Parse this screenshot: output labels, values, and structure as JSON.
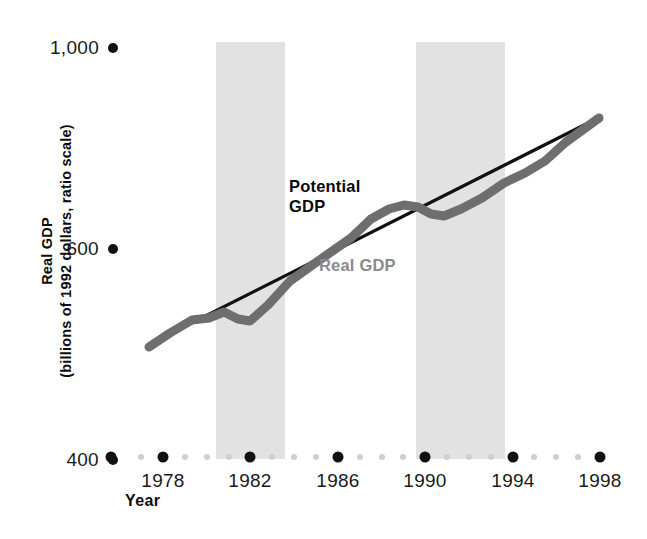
{
  "chart_data": {
    "type": "line",
    "title": "",
    "xlabel": "Year",
    "ylabel": "Real GDP\n(billions of 1992 dollars, ratio scale)",
    "yscale": "ratio (log)",
    "ylim": [
      400,
      1000
    ],
    "yticks": [
      400,
      600,
      1000
    ],
    "ytick_labels": [
      "400",
      "600",
      "1,000"
    ],
    "xlim": [
      1977,
      1999
    ],
    "xticks": [
      1978,
      1982,
      1986,
      1990,
      1994,
      1998
    ],
    "xtick_labels": [
      "1978",
      "1982",
      "1986",
      "1990",
      "1994",
      "1998"
    ],
    "x_minor_ticks_between": 3,
    "grid": false,
    "legend_position": "inline-annotations",
    "series": [
      {
        "name": "Potential GDP",
        "color": "#111111",
        "style": "thin straight trend line",
        "x": [
          1977.5,
          1998.6
        ],
        "values": [
          512,
          905
        ]
      },
      {
        "name": "Real GDP",
        "color": "#6e6e6e",
        "style": "thick wavy line",
        "x": [
          1977.5,
          1978.5,
          1979.5,
          1980.3,
          1981.0,
          1981.6,
          1982.2,
          1983.0,
          1984.0,
          1985.0,
          1986.0,
          1987.0,
          1988.0,
          1988.8,
          1989.5,
          1990.2,
          1990.8,
          1991.4,
          1992.2,
          1993.2,
          1994.2,
          1995.2,
          1996.2,
          1997.2,
          1998.6
        ],
        "values": [
          509,
          527,
          545,
          548,
          556,
          548,
          545,
          568,
          604,
          628,
          650,
          672,
          702,
          716,
          722,
          719,
          710,
          706,
          716,
          733,
          757,
          776,
          800,
          836,
          900
        ]
      }
    ],
    "shaded_bands": [
      {
        "label": "recession",
        "x_start": 1980.9,
        "x_end": 1983.0
      },
      {
        "label": "recession",
        "x_start": 1990.1,
        "x_end": 1992.8
      }
    ],
    "annotations": [
      {
        "text": "Potential\nGDP",
        "color": "#0b0b0b"
      },
      {
        "text": "Real GDP",
        "color": "#8a8a8a"
      }
    ]
  },
  "axis": {
    "y_title": "Real GDP\n(billions of 1992 dollars, ratio scale)",
    "x_title": "Year"
  },
  "colors": {
    "band": "#e2e2e2",
    "potential_line": "#111111",
    "real_line": "#6e6e6e",
    "real_label": "#8a8a8a",
    "tick_major": "#111111",
    "tick_minor": "#cfcfcf"
  }
}
